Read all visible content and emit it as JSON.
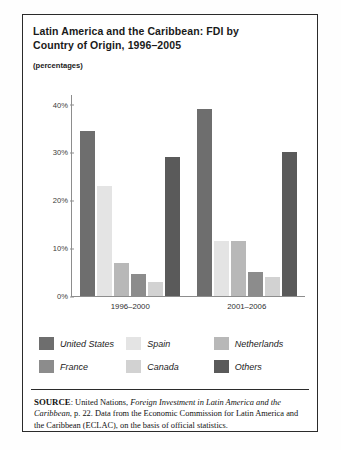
{
  "figure": {
    "title": "Latin America and the Caribbean: FDI by Country of Origin, 1996–2005",
    "title_line1": "Latin America and the Caribbean: FDI by",
    "title_line2": "Country of Origin, 1996–2005",
    "units_note": "(percentages)"
  },
  "chart_data": {
    "type": "bar",
    "title": "Latin America and the Caribbean: FDI by Country of Origin, 1996–2005",
    "subtitle": "(percentages)",
    "xlabel": "",
    "ylabel": "",
    "ylim": [
      0,
      42
    ],
    "grid": false,
    "legend_position": "bottom",
    "categories": [
      "1996–2000",
      "2001–2006"
    ],
    "ytick_labels": [
      "0%",
      "10%",
      "20%",
      "30%",
      "40%"
    ],
    "ytick_values": [
      0,
      10,
      20,
      30,
      40
    ],
    "series": [
      {
        "name": "United States",
        "color": "#6e6e6e",
        "values": [
          34.5,
          39.0
        ]
      },
      {
        "name": "Spain",
        "color": "#e4e4e4",
        "values": [
          23.0,
          11.5
        ]
      },
      {
        "name": "Netherlands",
        "color": "#b8b8b8",
        "values": [
          7.0,
          11.5
        ]
      },
      {
        "name": "France",
        "color": "#8c8c8c",
        "values": [
          4.5,
          5.0
        ]
      },
      {
        "name": "Canada",
        "color": "#d2d2d2",
        "values": [
          3.0,
          4.0
        ]
      },
      {
        "name": "Others",
        "color": "#5a5a5a",
        "values": [
          29.0,
          30.0
        ]
      }
    ]
  },
  "source": {
    "label": "SOURCE",
    "text_before": ": United Nations, ",
    "italic_title": "Foreign Investment in Latin America and the Caribbean",
    "text_after": ", p. 22. Data from the Economic Commission for Latin America and the Caribbean (ECLAC), on the basis of official statistics."
  }
}
